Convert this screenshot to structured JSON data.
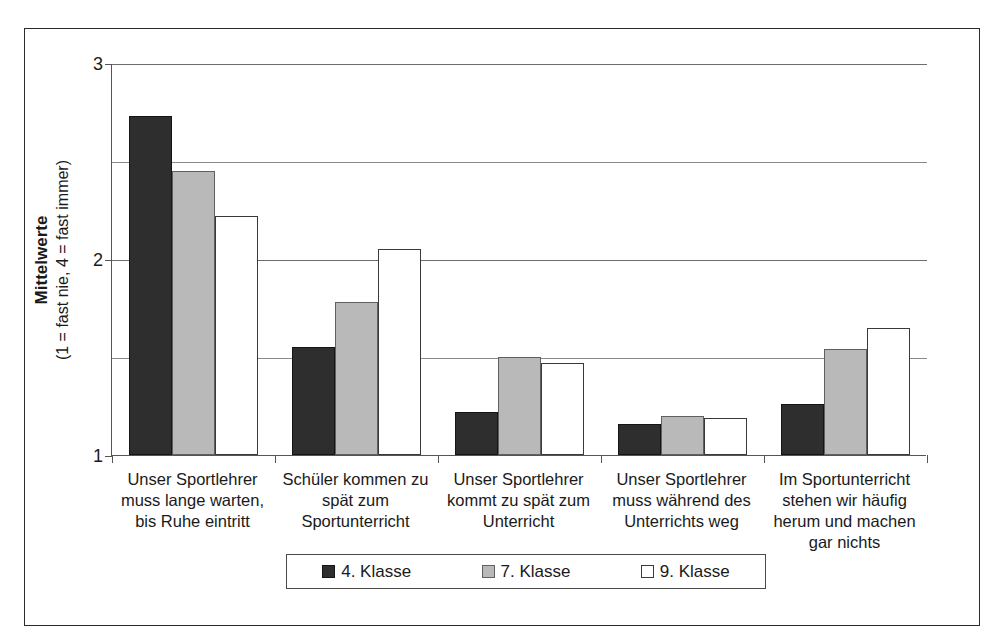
{
  "chart_data": {
    "type": "bar",
    "title": "",
    "xlabel": "",
    "ylabel": "Mittelwerte",
    "ylabel_sub": "(1 = fast nie, 4 = fast immer)",
    "ylim": [
      1,
      3
    ],
    "yticks": [
      1,
      2,
      3
    ],
    "ytick_labels": [
      "1",
      "2",
      "3"
    ],
    "gridlines": [
      1.5,
      2.0,
      2.5,
      3.0
    ],
    "grid": true,
    "legend_position": "bottom",
    "categories": [
      "Unser Sportlehrer muss lange warten, bis Ruhe eintritt",
      "Schüler kommen zu spät zum Sportunterricht",
      "Unser Sportlehrer kommt zu spät zum Unterricht",
      "Unser Sportlehrer muss während des Unterrichts weg",
      "Im Sportunterricht stehen wir häufig herum und machen gar nichts"
    ],
    "category_lines": [
      [
        "Unser Sportlehrer",
        "muss lange warten,",
        "bis Ruhe eintritt"
      ],
      [
        "Schüler kommen zu",
        "spät zum",
        "Sportunterricht"
      ],
      [
        "Unser Sportlehrer",
        "kommt zu spät zum",
        "Unterricht"
      ],
      [
        "Unser Sportlehrer",
        "muss während des",
        "Unterrichts weg"
      ],
      [
        "Im Sportunterricht",
        "stehen wir häufig",
        "herum und machen",
        "gar nichts"
      ]
    ],
    "series": [
      {
        "name": "4. Klasse",
        "color": "#2e2e2e",
        "values": [
          2.73,
          1.55,
          1.22,
          1.16,
          1.26
        ]
      },
      {
        "name": "7. Klasse",
        "color": "#b9b9b9",
        "values": [
          2.45,
          1.78,
          1.5,
          1.2,
          1.54
        ]
      },
      {
        "name": "9. Klasse",
        "color": "#ffffff",
        "values": [
          2.22,
          2.05,
          1.47,
          1.19,
          1.65
        ]
      }
    ]
  },
  "legend": {
    "items": [
      {
        "label": "4. Klasse",
        "swatch": "black-square"
      },
      {
        "label": "7. Klasse",
        "swatch": "gray-square"
      },
      {
        "label": "9. Klasse",
        "swatch": "white-square"
      }
    ]
  },
  "caption_ghost": ""
}
